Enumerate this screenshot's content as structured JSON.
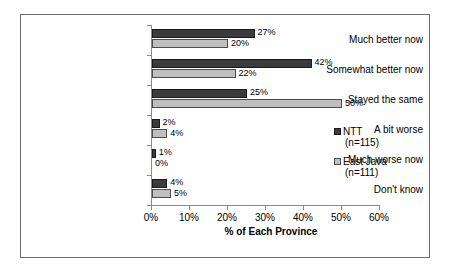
{
  "chart_data": {
    "type": "bar",
    "orientation": "horizontal",
    "title": "",
    "xlabel": "% of Each Province",
    "ylabel": "",
    "xlim": [
      0,
      60
    ],
    "xticks": [
      "0%",
      "10%",
      "20%",
      "30%",
      "40%",
      "50%",
      "60%"
    ],
    "xtick_values": [
      0,
      10,
      20,
      30,
      40,
      50,
      60
    ],
    "grid": false,
    "legend_position": "right",
    "categories": [
      "Much better now",
      "Somewhat better now",
      "Stayed the same",
      "A bit worse",
      "Much worse now",
      "Don't know"
    ],
    "series": [
      {
        "name": "NTT",
        "sublabel": "(n=115)",
        "color": "#3b3b3b",
        "values": [
          27,
          42,
          25,
          2,
          1,
          4
        ],
        "labels": [
          "27%",
          "42%",
          "25%",
          "2%",
          "1%",
          "4%"
        ]
      },
      {
        "name": "East Java",
        "sublabel": "(n=111)",
        "color": "#bfbfbf",
        "values": [
          20,
          22,
          50,
          4,
          0,
          5
        ],
        "labels": [
          "20%",
          "22%",
          "50%",
          "4%",
          "0%",
          "5%"
        ]
      }
    ]
  },
  "legend": {
    "entries": [
      {
        "name": "NTT",
        "sublabel": "(n=115)"
      },
      {
        "name": "East Java",
        "sublabel": "(n=111)"
      }
    ]
  },
  "axis": {
    "x_title": "% of Each Province"
  }
}
